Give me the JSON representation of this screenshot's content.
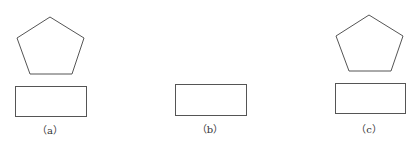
{
  "figure": {
    "stroke_color": "#555555",
    "panels": [
      {
        "id": "a",
        "label": "（a）",
        "label_pos": [
          50,
          122
        ],
        "shapes": [
          {
            "type": "pentagon",
            "points": [
              [
                50,
                17
              ],
              [
                84,
                38
              ],
              [
                72,
                74
              ],
              [
                30,
                74
              ],
              [
                17,
                38
              ]
            ]
          },
          {
            "type": "rectangle",
            "x": 15,
            "y": 86,
            "width": 71,
            "height": 30
          }
        ]
      },
      {
        "id": "b",
        "label": "（b）",
        "label_pos": [
          210,
          121
        ],
        "shapes": [
          {
            "type": "rectangle",
            "x": 175,
            "y": 84,
            "width": 71,
            "height": 31
          }
        ]
      },
      {
        "id": "c",
        "label": "（c）",
        "label_pos": [
          369,
          121
        ],
        "shapes": [
          {
            "type": "pentagon",
            "points": [
              [
                369,
                15
              ],
              [
                403,
                36
              ],
              [
                391,
                71
              ],
              [
                349,
                71
              ],
              [
                336,
                36
              ]
            ]
          },
          {
            "type": "rectangle",
            "x": 335,
            "y": 83,
            "width": 70,
            "height": 30
          }
        ]
      }
    ]
  }
}
